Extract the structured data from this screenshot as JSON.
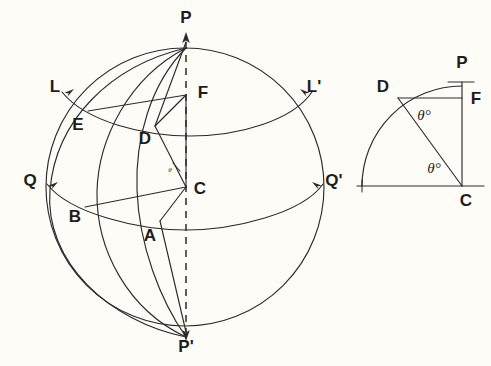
{
  "figure": {
    "kind": "geometry-diagram",
    "background_color": "#fdfcf7",
    "ink_color": "#2b2b2b"
  },
  "sphere": {
    "center": {
      "cx": 185,
      "cy": 187,
      "r": 139
    },
    "labels": {
      "north_pole": "P",
      "south_pole": "P'",
      "equator_left": "Q",
      "equator_right": "Q'",
      "parallel_left": "L",
      "parallel_right": "L'",
      "center": "C",
      "foot_on_axis": "F",
      "point_d": "D",
      "point_e": "E",
      "point_a": "A",
      "point_b": "B"
    },
    "angle_marker": "θ"
  },
  "inset": {
    "labels": {
      "pole": "P",
      "point_d": "D",
      "foot": "F",
      "center": "C"
    },
    "angle_at_d": "θ°",
    "angle_at_c": "θ°"
  }
}
